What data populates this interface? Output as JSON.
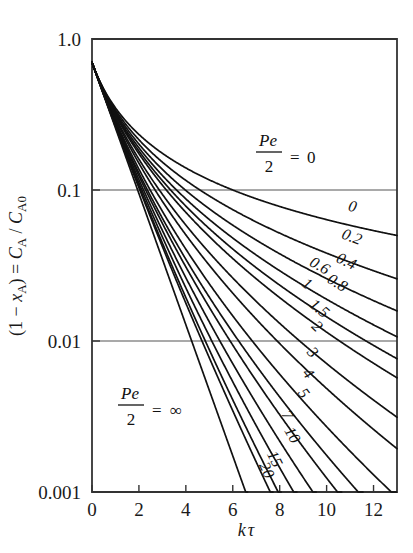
{
  "chart_data": {
    "type": "line",
    "title": "",
    "xlabel": "kτ",
    "ylabel": "(1 − x_A) = C_A / C_A0",
    "yscale": "log",
    "xscale": "linear",
    "xlim": [
      0,
      13
    ],
    "ylim": [
      0.001,
      1.0
    ],
    "grid": "horizontal-at-decades",
    "legend": "inline-curve-labels",
    "x_ticks": [
      0,
      2,
      4,
      6,
      8,
      10,
      12
    ],
    "x_tick_labels": [
      "0",
      "2",
      "4",
      "6",
      "8",
      "10",
      "12"
    ],
    "y_ticks": [
      1.0,
      0.1,
      0.01,
      0.001
    ],
    "y_tick_labels": [
      "1.0",
      "0.1",
      "0.01",
      "0.001"
    ],
    "annotations": [
      {
        "text_num": "Pe",
        "text_den": "2",
        "eq": "= 0",
        "x": 7.2,
        "y": 0.4
      },
      {
        "text_num": "Pe",
        "text_den": "2",
        "eq": "= ∞",
        "x": 2.3,
        "y": 0.0035
      }
    ],
    "series_param_name": "Pe/2",
    "series": [
      {
        "name": "0",
        "label": "0",
        "label_x": 11.05,
        "label_y": 0.072
      },
      {
        "name": "0.2",
        "label": "0.2",
        "label_x": 11.0,
        "label_y": 0.0455
      },
      {
        "name": "0.4",
        "label": "0.4",
        "label_x": 10.75,
        "label_y": 0.0315
      },
      {
        "name": "0.6",
        "label": "0.6",
        "label_x": 9.6,
        "label_y": 0.0295
      },
      {
        "name": "0.8",
        "label": "0.8",
        "label_x": 10.35,
        "label_y": 0.0228
      },
      {
        "name": "1",
        "label": "1",
        "label_x": 9.05,
        "label_y": 0.0225
      },
      {
        "name": "1.5",
        "label": "1.5",
        "label_x": 9.55,
        "label_y": 0.0155
      },
      {
        "name": "2",
        "label": "2",
        "label_x": 9.45,
        "label_y": 0.0118
      },
      {
        "name": "3",
        "label": "3",
        "label_x": 9.25,
        "label_y": 0.008
      },
      {
        "name": "4",
        "label": "4",
        "label_x": 9.05,
        "label_y": 0.0058
      },
      {
        "name": "5",
        "label": "5",
        "label_x": 8.85,
        "label_y": 0.0043
      },
      {
        "name": "7",
        "label": "7",
        "label_x": 8.15,
        "label_y": 0.0031
      },
      {
        "name": "10",
        "label": "10",
        "label_x": 8.35,
        "label_y": 0.0023
      },
      {
        "name": "15",
        "label": "15",
        "label_x": 7.6,
        "label_y": 0.0016
      },
      {
        "name": "20",
        "label": "20",
        "label_x": 7.25,
        "label_y": 0.00135
      },
      {
        "name": "∞",
        "label": "",
        "label_x": 0,
        "label_y": 0
      }
    ],
    "curve_start_value": 0.7
  },
  "axis": {
    "y_labels": [
      "1.0",
      "0.1",
      "0.01",
      "0.001"
    ],
    "x_labels": [
      "0",
      "2",
      "4",
      "6",
      "8",
      "10",
      "12"
    ],
    "x_title_k": "k",
    "x_title_tau": "τ",
    "y_title_open": "(1 − ",
    "y_title_x": "x",
    "y_title_xsub": "A",
    "y_title_mid": ") = ",
    "y_title_c": "C",
    "y_title_csub": "A",
    "y_title_slash": " / ",
    "y_title_c2": "C",
    "y_title_c2sub": "A0"
  },
  "annotations": {
    "top": {
      "pe": "Pe",
      "two": "2",
      "eq": "=",
      "val": "0"
    },
    "bottom": {
      "pe": "Pe",
      "two": "2",
      "eq": "=",
      "val": "∞"
    }
  },
  "colors": {
    "ink": "#111111",
    "frame": "#333333",
    "grid": "#555555",
    "background": "#ffffff"
  }
}
